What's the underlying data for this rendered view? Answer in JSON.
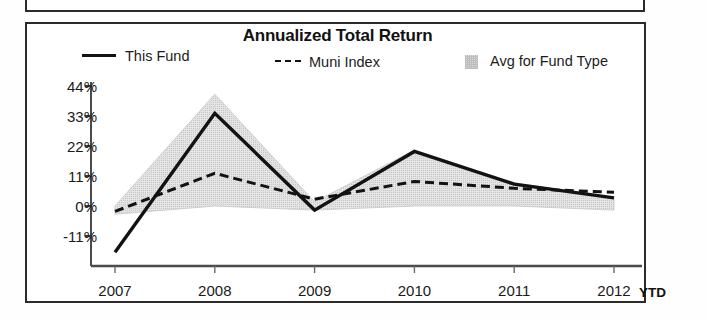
{
  "chart_data": {
    "type": "line",
    "title": "Annualized Total Return",
    "xlabel": "",
    "ylabel": "",
    "categories": [
      "2007",
      "2008",
      "2009",
      "2010",
      "2011",
      "2012"
    ],
    "x_axis_note": "YTD",
    "ytick_labels": [
      "44%",
      "33%",
      "22%",
      "11%",
      "0%",
      "-11%"
    ],
    "ytick_values": [
      44,
      33,
      22,
      11,
      0,
      -11
    ],
    "ylim": [
      -22,
      44
    ],
    "grid": false,
    "legend_position": "top",
    "series": [
      {
        "name": "This Fund",
        "style": "solid",
        "color": "#121212",
        "values": [
          -17.0,
          34.0,
          -1.5,
          20.0,
          8.0,
          3.0
        ]
      },
      {
        "name": "Muni Index",
        "style": "dashed",
        "color": "#121212",
        "values": [
          -2.0,
          12.0,
          2.5,
          9.0,
          6.5,
          5.0
        ]
      },
      {
        "name": "Avg for Fund Type",
        "style": "band",
        "color": "#dcdcdc",
        "upper": [
          0.0,
          41.0,
          1.5,
          20.5,
          8.5,
          3.0
        ],
        "lower": [
          -3.0,
          0.0,
          -1.5,
          0.0,
          0.0,
          -1.5
        ]
      }
    ]
  },
  "chart": {
    "title": "Annualized Total Return",
    "legend": [
      {
        "label": "This Fund",
        "marker": "solid-line-swatch"
      },
      {
        "label": "Muni Index",
        "marker": "dashed-line-swatch"
      },
      {
        "label": "Avg for Fund Type",
        "marker": "shaded-band-swatch"
      }
    ],
    "y_ticks": [
      "44%",
      "33%",
      "22%",
      "11%",
      "0%",
      "-11%"
    ],
    "x_ticks": [
      "2007",
      "2008",
      "2009",
      "2010",
      "2011",
      "2012"
    ],
    "x_suffix": "YTD"
  }
}
